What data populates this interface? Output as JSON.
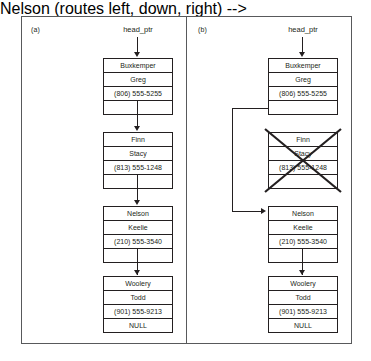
{
  "figure": {
    "colors": {
      "ink": "#231f20",
      "frame": "#58595b",
      "background": "#ffffff"
    }
  },
  "panels": [
    {
      "id": "a",
      "label": "(a)",
      "pointer_label": "head_ptr",
      "nodes": [
        {
          "id": "buxkemper",
          "last_name": "Buxkemper",
          "first_name": "Greg",
          "phone": "(806) 555-5255",
          "next": "",
          "deleted": false
        },
        {
          "id": "finn",
          "last_name": "Finn",
          "first_name": "Stacy",
          "phone": "(813) 555-1248",
          "next": "",
          "deleted": false
        },
        {
          "id": "nelson",
          "last_name": "Nelson",
          "first_name": "Keelie",
          "phone": "(210) 555-3540",
          "next": "",
          "deleted": false
        },
        {
          "id": "woolery",
          "last_name": "Woolery",
          "first_name": "Todd",
          "phone": "(901) 555-9213",
          "next": "NULL",
          "deleted": false
        }
      ]
    },
    {
      "id": "b",
      "label": "(b)",
      "pointer_label": "head_ptr",
      "nodes": [
        {
          "id": "buxkemper",
          "last_name": "Buxkemper",
          "first_name": "Greg",
          "phone": "(806) 555-5255",
          "next": "",
          "deleted": false
        },
        {
          "id": "finn",
          "last_name": "Finn",
          "first_name": "Stacy",
          "phone": "(813) 555-1248",
          "next": "",
          "deleted": true
        },
        {
          "id": "nelson",
          "last_name": "Nelson",
          "first_name": "Keelie",
          "phone": "(210) 555-3540",
          "next": "",
          "deleted": false
        },
        {
          "id": "woolery",
          "last_name": "Woolery",
          "first_name": "Todd",
          "phone": "(901) 555-9213",
          "next": "NULL",
          "deleted": false
        }
      ]
    }
  ]
}
